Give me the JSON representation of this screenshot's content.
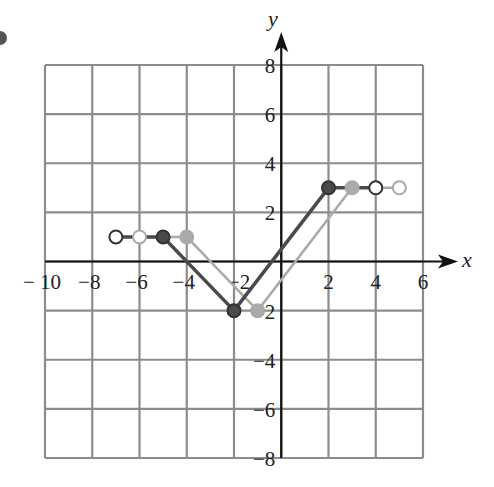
{
  "chart_data": {
    "type": "line",
    "title": "",
    "xlabel": "x",
    "ylabel": "y",
    "xlim": [
      -10,
      6
    ],
    "ylim": [
      -8,
      8
    ],
    "grid": true,
    "grid_step": 2,
    "x_ticks": [
      -10,
      -8,
      -6,
      -4,
      2,
      4,
      6
    ],
    "x_tick_labels": [
      "− 10",
      "−8",
      "−6",
      "−4",
      "2",
      "4",
      "6"
    ],
    "y_ticks": [
      8,
      6,
      4,
      2,
      -2,
      -4,
      -6,
      -8
    ],
    "y_tick_labels": [
      "8",
      "6",
      "4",
      "2",
      "−2",
      "−4",
      "−6",
      "−8"
    ],
    "extra_label": {
      "text": "−2",
      "x": -2,
      "y": 0,
      "note": "x-axis tick label −2 drawn above-left of the vertex"
    },
    "series": [
      {
        "name": "original",
        "color": "#4a4a4a",
        "points": [
          [
            -7,
            1
          ],
          [
            -5,
            1
          ],
          [
            -2,
            -2
          ],
          [
            2,
            3
          ],
          [
            4,
            3
          ]
        ],
        "markers": [
          {
            "x": -7,
            "y": 1,
            "style": "open"
          },
          {
            "x": -5,
            "y": 1,
            "style": "filled"
          },
          {
            "x": -2,
            "y": -2,
            "style": "filled"
          },
          {
            "x": 2,
            "y": 3,
            "style": "filled"
          },
          {
            "x": 4,
            "y": 3,
            "style": "open"
          }
        ]
      },
      {
        "name": "shifted",
        "color": "#aaaaaa",
        "points": [
          [
            -6,
            1
          ],
          [
            -4,
            1
          ],
          [
            -1,
            -2
          ],
          [
            3,
            3
          ],
          [
            5,
            3
          ]
        ],
        "markers": [
          {
            "x": -6,
            "y": 1,
            "style": "open"
          },
          {
            "x": -4,
            "y": 1,
            "style": "filled"
          },
          {
            "x": -1,
            "y": -2,
            "style": "filled"
          },
          {
            "x": 3,
            "y": 3,
            "style": "filled"
          },
          {
            "x": 5,
            "y": 3,
            "style": "open"
          }
        ]
      }
    ]
  },
  "colors": {
    "grid": "#8c8c8c",
    "axis": "#111111",
    "dark_series": "#4a4a4a",
    "light_series": "#aaaaaa"
  }
}
